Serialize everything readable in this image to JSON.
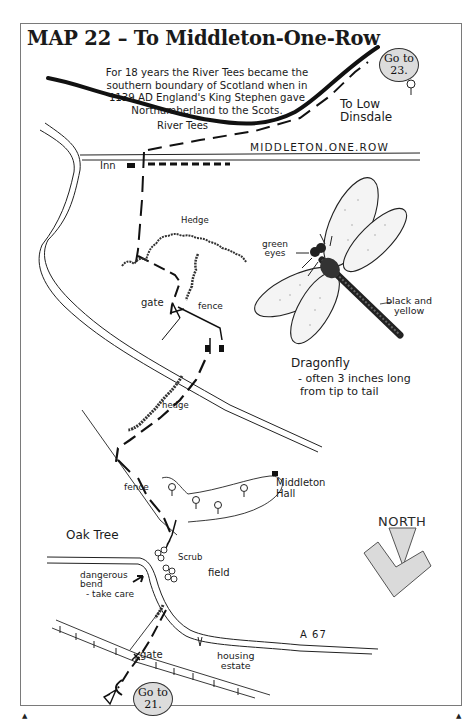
{
  "page": {
    "title": "MAP 22 – To Middleton-One-Row",
    "frame_color": "#7a7a7a",
    "ink_color": "#1a1a1a",
    "badge_fill": "#dcdcdc",
    "arrow_fill": "#dadada"
  },
  "history_note": {
    "lines": [
      "For 18 years the River Tees became the",
      "southern boundary of Scotland when in",
      "1139 AD England's King Stephen gave",
      "Northumberland to the Scots."
    ]
  },
  "navigation": {
    "goto_top": {
      "line1": "Go to",
      "line2": "23."
    },
    "goto_bottom": {
      "line1": "Go to",
      "line2": "21."
    }
  },
  "labels": {
    "to_low_dinsdale_1": "To Low",
    "to_low_dinsdale_2": "Dinsdale",
    "river_tees": "River Tees",
    "village": "MIDDLETON.ONE.ROW",
    "inn": "Inn",
    "hedge_upper": "Hedge",
    "gate_upper": "gate",
    "fence_upper": "fence",
    "hedge_lower": "hedge",
    "fence_lower": "fence",
    "middleton_hall_1": "Middleton",
    "middleton_hall_2": "Hall",
    "oak_tree": "Oak Tree",
    "scrub": "Scrub",
    "field": "field",
    "dangerous_1": "dangerous",
    "dangerous_2": "bend",
    "dangerous_3": "- take care",
    "road_a67": "A 67",
    "gate_lower": "gate",
    "housing_1": "housing",
    "housing_2": "estate"
  },
  "dragonfly": {
    "eyes_1": "green",
    "eyes_2": "eyes",
    "body_1": "black and",
    "body_2": "yellow",
    "title": "Dragonfly",
    "caption_1": "- often 3 inches long",
    "caption_2": "from tip to tail"
  },
  "compass": {
    "label": "NORTH"
  }
}
